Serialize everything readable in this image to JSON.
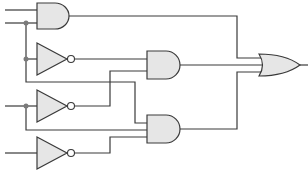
{
  "diagram": {
    "type": "logic-circuit",
    "inputs": 5,
    "gates": [
      {
        "id": "and-top",
        "kind": "AND",
        "inputs": 2
      },
      {
        "id": "not-1",
        "kind": "NOT"
      },
      {
        "id": "not-2",
        "kind": "NOT"
      },
      {
        "id": "not-3",
        "kind": "NOT"
      },
      {
        "id": "and-middle",
        "kind": "AND",
        "inputs": 2
      },
      {
        "id": "and-bottom",
        "kind": "AND",
        "inputs": 3
      },
      {
        "id": "or-output",
        "kind": "OR",
        "inputs": 3
      }
    ],
    "colors": {
      "wire": "#3a3a3a",
      "gate_fill": "#e6e6e6",
      "junction": "#7a7a7a"
    }
  }
}
